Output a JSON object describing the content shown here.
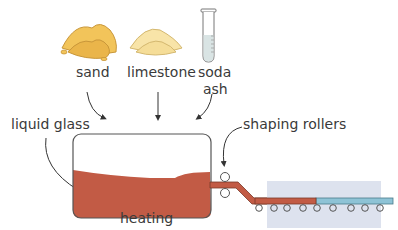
{
  "diagram": {
    "title": "",
    "ingredients": [
      {
        "label": "sand"
      },
      {
        "label": "limestone"
      },
      {
        "label": "soda",
        "label2": "ash"
      }
    ],
    "labels": {
      "liquid_glass": "liquid glass",
      "shaping_rollers": "shaping rollers",
      "heating": "heating"
    },
    "colors": {
      "sand": "#f2c45a",
      "limestone": "#f8e4a8",
      "soda_ash": "#d9e4e4",
      "molten_glass": "#c25b45",
      "cooled_glass": "#8ec3d6",
      "cooling_zone": "#dde2ee",
      "outline": "#555555"
    }
  }
}
